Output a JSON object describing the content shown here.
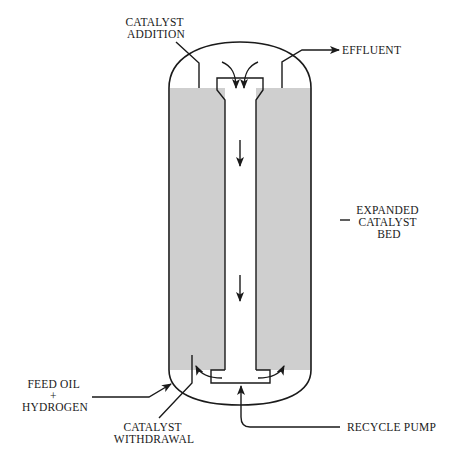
{
  "diagram": {
    "colors": {
      "line": "#1a1a1a",
      "catalyst_bed": "#cfcfcf",
      "background": "#ffffff"
    },
    "labels": {
      "catalyst_addition_line1": "CATALYST",
      "catalyst_addition_line2": "ADDITION",
      "effluent": "EFFLUENT",
      "expanded_bed_line1": "EXPANDED",
      "expanded_bed_line2": "CATALYST",
      "expanded_bed_line3": "BED",
      "feed_line1": "FEED OIL",
      "feed_line2": "+",
      "feed_line3": "HYDROGEN",
      "catalyst_withdrawal_line1": "CATALYST",
      "catalyst_withdrawal_line2": "WITHDRAWAL",
      "recycle_pump": "RECYCLE PUMP"
    },
    "components": [
      "reactor-vessel",
      "expanded-catalyst-bed",
      "central-downcomer-tube",
      "recycle-cup",
      "catalyst-addition-line",
      "catalyst-withdrawal-line",
      "effluent-line",
      "feed-inlet-line",
      "recycle-pump-line"
    ]
  }
}
